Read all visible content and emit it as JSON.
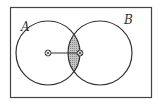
{
  "diagram": {
    "type": "venn",
    "sets": [
      {
        "id": "A",
        "label": "A"
      },
      {
        "id": "B",
        "label": "B"
      }
    ],
    "shaded_region": "A ∩ B",
    "markers": [
      {
        "name": "point-in-A",
        "symbol": "circled-times"
      },
      {
        "name": "point-in-intersection",
        "symbol": "circled-times"
      }
    ],
    "colors": {
      "stroke": "#333333",
      "shade": "#b8b8b8",
      "background": "#ffffff"
    }
  }
}
